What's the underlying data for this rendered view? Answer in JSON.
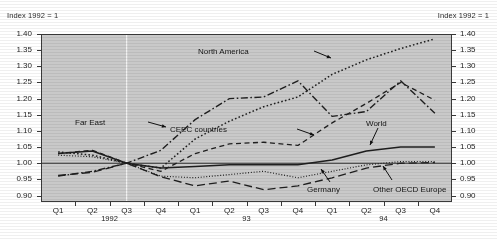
{
  "notes": {
    "left": "Index 1992 = 1",
    "right": "Index 1992 = 1"
  },
  "chart_data": {
    "type": "line",
    "title": "",
    "xlabel": "",
    "ylabel": "Index 1992 = 1",
    "ylim": [
      0.88,
      1.4
    ],
    "yticks": [
      "1.40",
      "1.35",
      "1.30",
      "1.25",
      "1.20",
      "1.15",
      "1.10",
      "1.05",
      "1.00",
      "0.95",
      "0.90"
    ],
    "ytick_values": [
      1.4,
      1.35,
      1.3,
      1.25,
      1.2,
      1.15,
      1.1,
      1.05,
      1.0,
      0.95,
      0.9
    ],
    "grid": false,
    "legend_position": "inline-annotations",
    "reference_line": 1.0,
    "base_period_marker": "Q3 1992",
    "categories": [
      "Q1",
      "Q2",
      "Q3",
      "Q4",
      "Q1",
      "Q2",
      "Q3",
      "Q4",
      "Q1",
      "Q2",
      "Q3",
      "Q4"
    ],
    "years": [
      "1992",
      "93",
      "94"
    ],
    "series": [
      {
        "name": "North America",
        "style": "dotted",
        "values": [
          1.035,
          1.025,
          1.0,
          0.985,
          1.075,
          1.13,
          1.175,
          1.205,
          1.275,
          1.32,
          1.355,
          1.385
        ]
      },
      {
        "name": "Far East",
        "style": "dash-dot",
        "values": [
          0.96,
          0.975,
          1.0,
          1.04,
          1.135,
          1.2,
          1.205,
          1.255,
          1.145,
          1.16,
          1.255,
          1.155
        ]
      },
      {
        "name": "CEEC countries",
        "style": "dashed",
        "values": [
          1.03,
          1.04,
          1.0,
          0.975,
          1.03,
          1.06,
          1.065,
          1.055,
          1.125,
          1.185,
          1.25,
          1.195
        ]
      },
      {
        "name": "World",
        "style": "solid",
        "values": [
          1.03,
          1.038,
          1.0,
          0.985,
          0.99,
          0.995,
          0.995,
          0.995,
          1.01,
          1.038,
          1.05,
          1.05
        ]
      },
      {
        "name": "Germany",
        "style": "fine-dotted",
        "values": [
          1.025,
          1.02,
          1.0,
          0.96,
          0.955,
          0.965,
          0.975,
          0.955,
          0.975,
          0.995,
          1.005,
          1.005
        ]
      },
      {
        "name": "Other OECD Europe",
        "style": "long-dash",
        "values": [
          0.962,
          0.972,
          1.0,
          0.958,
          0.93,
          0.945,
          0.918,
          0.93,
          0.955,
          0.985,
          1.0,
          1.002
        ]
      }
    ],
    "annotations": [
      {
        "text": "Far East",
        "x": 105,
        "y": 118
      },
      {
        "text": "North America",
        "x": 249,
        "y": 47
      },
      {
        "text": "CEEC countries",
        "x": 227,
        "y": 125
      },
      {
        "text": "World",
        "x": 366,
        "y": 119
      },
      {
        "text": "Germany",
        "x": 307,
        "y": 185
      },
      {
        "text": "Other OECD Europe",
        "x": 373,
        "y": 185
      }
    ]
  }
}
